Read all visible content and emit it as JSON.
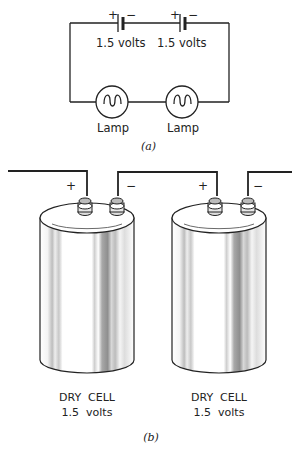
{
  "figure_a": {
    "caption": "(a)",
    "batteries": [
      {
        "plus": "+",
        "minus": "−",
        "label": "1.5 volts"
      },
      {
        "plus": "+",
        "minus": "−",
        "label": "1.5 volts"
      }
    ],
    "lamps": [
      {
        "label": "Lamp"
      },
      {
        "label": "Lamp"
      }
    ]
  },
  "figure_b": {
    "caption": "(b)",
    "cells": [
      {
        "name": "DRY  CELL",
        "voltage": "1.5  volts",
        "plus": "+",
        "minus": "−"
      },
      {
        "name": "DRY  CELL",
        "voltage": "1.5  volts",
        "plus": "+",
        "minus": "−"
      }
    ]
  },
  "colors": {
    "line": "#222222",
    "background": "#ffffff",
    "shade": "#9a9a9a"
  }
}
